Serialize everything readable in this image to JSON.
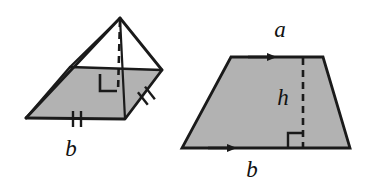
{
  "canvas": {
    "width": 373,
    "height": 182,
    "background": "#ffffff"
  },
  "style": {
    "fill_gray": "#b2b2b2",
    "stroke_black": "#1a1a1a",
    "stroke_width": 2.6,
    "dash_pattern": "7 5"
  },
  "figures": {
    "pyramid": {
      "name": "square-pyramid",
      "description": "Oblique view of a pyramid with rhombus base, apex above, dashed altitude, right-angle marker and congruence tick marks",
      "apex": {
        "x": 120,
        "y": 18
      },
      "base_vertices": [
        {
          "name": "left",
          "x": 26,
          "y": 118
        },
        {
          "name": "back",
          "x": 70,
          "y": 67
        },
        {
          "name": "right",
          "x": 162,
          "y": 70
        },
        {
          "name": "front",
          "x": 125,
          "y": 119
        }
      ],
      "altitude": {
        "x1": 120,
        "y1": 18,
        "x2": 118,
        "y2": 93
      },
      "right_angle_marker": {
        "x": 100,
        "y": 74,
        "size": 17
      },
      "tick_marks": [
        {
          "name": "base-front-left-double-tick",
          "count": 2,
          "x": 76,
          "y": 119,
          "angle": 0
        },
        {
          "name": "base-front-right-double-tick",
          "count": 2,
          "x": 146,
          "y": 96,
          "angle": -38
        }
      ],
      "label": {
        "text": "b",
        "x": 71,
        "y": 156,
        "name": "pyramid-base-edge-label-b"
      }
    },
    "trapezoid": {
      "name": "trapezoid",
      "description": "Trapezoid with parallel sides a (top) and b (bottom) marked by single arrowheads, and dashed height h with right-angle marker",
      "vertices": [
        {
          "name": "top-left",
          "x": 231,
          "y": 57
        },
        {
          "name": "top-right",
          "x": 323,
          "y": 57
        },
        {
          "name": "bottom-right",
          "x": 350,
          "y": 148
        },
        {
          "name": "bottom-left",
          "x": 182,
          "y": 148
        }
      ],
      "height_line": {
        "x1": 303,
        "y1": 57,
        "x2": 303,
        "y2": 148
      },
      "right_angle_marker": {
        "x": 288,
        "y": 133,
        "size": 15
      },
      "arrow_marks": [
        {
          "name": "top-parallel-arrow",
          "x": 262,
          "y": 57,
          "direction": "right"
        },
        {
          "name": "bottom-parallel-arrow",
          "x": 222,
          "y": 148,
          "direction": "right"
        }
      ],
      "labels": [
        {
          "text": "a",
          "x": 280,
          "y": 37,
          "name": "trapezoid-top-label-a"
        },
        {
          "text": "h",
          "x": 283,
          "y": 105,
          "name": "trapezoid-height-label-h"
        },
        {
          "text": "b",
          "x": 252,
          "y": 177,
          "name": "trapezoid-bottom-label-b"
        }
      ]
    }
  }
}
